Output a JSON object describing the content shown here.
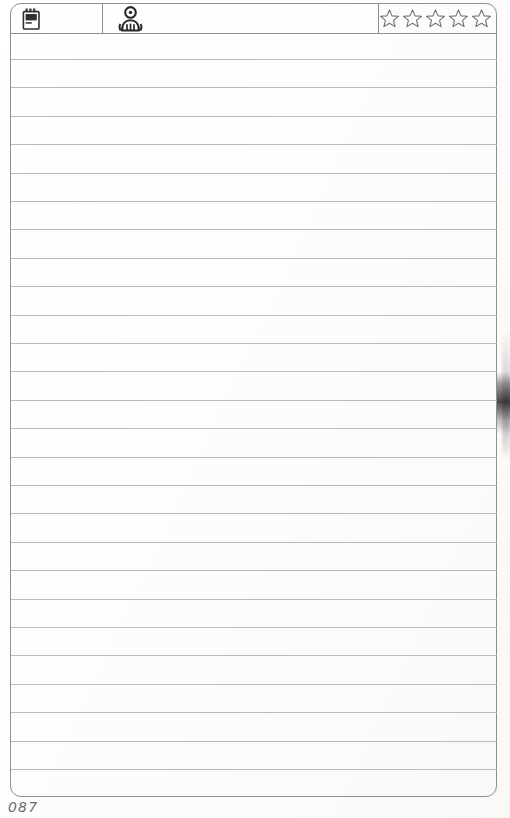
{
  "document": {
    "type": "ruled-notebook-page",
    "page_number": "087",
    "paper_color": "#fdfdfd",
    "rule_color": "#b9babc",
    "border_color": "#8e8f91"
  },
  "header": {
    "cells": [
      {
        "icon": "notepad-icon",
        "label": ""
      },
      {
        "icon": "person-avatar-icon",
        "label": ""
      },
      {
        "icon": "star-rating-icon",
        "label": ""
      }
    ],
    "rating": {
      "name": "star-rating",
      "max": 5,
      "filled": 0,
      "stars": [
        "empty",
        "empty",
        "empty",
        "empty",
        "empty"
      ]
    }
  },
  "body": {
    "ruled_line_count": 26,
    "lines": [
      {
        "text": ""
      },
      {
        "text": ""
      },
      {
        "text": ""
      },
      {
        "text": ""
      },
      {
        "text": ""
      },
      {
        "text": ""
      },
      {
        "text": ""
      },
      {
        "text": ""
      },
      {
        "text": ""
      },
      {
        "text": ""
      },
      {
        "text": ""
      },
      {
        "text": ""
      },
      {
        "text": ""
      },
      {
        "text": ""
      },
      {
        "text": ""
      },
      {
        "text": ""
      },
      {
        "text": ""
      },
      {
        "text": ""
      },
      {
        "text": ""
      },
      {
        "text": ""
      },
      {
        "text": ""
      },
      {
        "text": ""
      },
      {
        "text": ""
      },
      {
        "text": ""
      },
      {
        "text": ""
      },
      {
        "text": ""
      }
    ]
  },
  "footer": {
    "page_number_label": "087"
  }
}
